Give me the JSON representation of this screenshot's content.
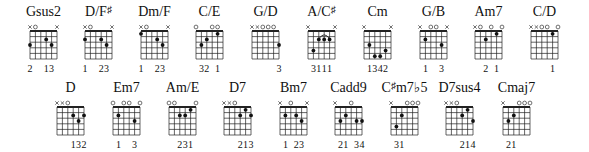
{
  "rows": [
    {
      "chords": [
        {
          "name": "Gsus2",
          "x": 30,
          "muted": [
            1,
            6
          ],
          "open": [
            2
          ],
          "nut": true,
          "dots": [
            [
              1,
              3
            ],
            [
              4,
              2
            ],
            [
              5,
              3
            ]
          ],
          "fingers": [
            [
              1,
              "2"
            ],
            [
              4,
              "1"
            ],
            [
              5,
              "3"
            ]
          ],
          "arc": null
        },
        {
          "name": "D/F",
          "sup": "♯",
          "x": 85,
          "muted": [
            1,
            6
          ],
          "open": [
            2
          ],
          "nut": true,
          "dots": [
            [
              1,
              2
            ],
            [
              4,
              2
            ],
            [
              5,
              3
            ]
          ],
          "fingers": [
            [
              1,
              "1"
            ],
            [
              4,
              "2"
            ],
            [
              5,
              "3"
            ]
          ],
          "arc": null
        },
        {
          "name": "Dm/F",
          "x": 141,
          "muted": [
            1,
            6
          ],
          "open": [
            2
          ],
          "nut": true,
          "dots": [
            [
              1,
              1
            ],
            [
              4,
              2
            ],
            [
              5,
              3
            ]
          ],
          "fingers": [
            [
              1,
              "1"
            ],
            [
              4,
              "2"
            ],
            [
              5,
              "3"
            ]
          ],
          "arc": null
        },
        {
          "name": "C/E",
          "x": 196,
          "muted": [],
          "open": [
            1,
            4,
            5
          ],
          "nut": true,
          "dots": [
            [
              2,
              3
            ],
            [
              3,
              2
            ],
            [
              5,
              1
            ]
          ],
          "fingers": [
            [
              2,
              "3"
            ],
            [
              3,
              "2"
            ],
            [
              5,
              "1"
            ]
          ],
          "arc": null
        },
        {
          "name": "G/D",
          "x": 252,
          "muted": [
            1,
            2
          ],
          "open": [
            3,
            4,
            5
          ],
          "nut": true,
          "dots": [
            [
              6,
              3
            ]
          ],
          "fingers": [
            [
              6,
              "3"
            ]
          ],
          "arc": null
        },
        {
          "name": "A/C",
          "sup": "♯",
          "x": 308,
          "muted": [
            1,
            6
          ],
          "open": [],
          "nut": true,
          "dots": [
            [
              2,
              4
            ],
            [
              3,
              2
            ],
            [
              4,
              2
            ],
            [
              5,
              2
            ]
          ],
          "fingers": [
            [
              2,
              "3"
            ],
            [
              3,
              "1"
            ],
            [
              4,
              "1"
            ],
            [
              5,
              "1"
            ]
          ],
          "arc": [
            3,
            5
          ]
        },
        {
          "name": "Cm",
          "x": 364,
          "muted": [
            1,
            6
          ],
          "open": [],
          "nut": true,
          "dots": [
            [
              2,
              3
            ],
            [
              3,
              5
            ],
            [
              4,
              5
            ],
            [
              5,
              4
            ]
          ],
          "fingers": [
            [
              2,
              "1"
            ],
            [
              3,
              "3"
            ],
            [
              4,
              "4"
            ],
            [
              5,
              "2"
            ]
          ],
          "arc": null
        },
        {
          "name": "G/B",
          "x": 420,
          "muted": [
            1,
            6
          ],
          "open": [
            3,
            4
          ],
          "nut": true,
          "dots": [
            [
              2,
              2
            ],
            [
              5,
              3
            ]
          ],
          "fingers": [
            [
              2,
              "1"
            ],
            [
              5,
              "3"
            ]
          ],
          "arc": null
        },
        {
          "name": "Am7",
          "x": 475,
          "muted": [
            1
          ],
          "open": [
            2,
            4,
            6
          ],
          "nut": true,
          "dots": [
            [
              3,
              2
            ],
            [
              5,
              1
            ]
          ],
          "fingers": [
            [
              3,
              "2"
            ],
            [
              5,
              "1"
            ]
          ],
          "arc": null
        },
        {
          "name": "C/D",
          "x": 531,
          "muted": [
            1,
            2
          ],
          "open": [
            3,
            4,
            6
          ],
          "nut": true,
          "dots": [
            [
              5,
              1
            ]
          ],
          "fingers": [
            [
              5,
              "1"
            ]
          ],
          "arc": null
        }
      ]
    },
    {
      "chords": [
        {
          "name": "D",
          "x": 57,
          "muted": [
            1,
            2
          ],
          "open": [
            3
          ],
          "nut": true,
          "dots": [
            [
              4,
              2
            ],
            [
              5,
              3
            ],
            [
              6,
              2
            ]
          ],
          "fingers": [
            [
              4,
              "1"
            ],
            [
              5,
              "3"
            ],
            [
              6,
              "2"
            ]
          ],
          "arc": null
        },
        {
          "name": "Em7",
          "x": 113,
          "muted": [],
          "open": [
            1,
            3,
            4,
            6
          ],
          "nut": true,
          "dots": [
            [
              2,
              2
            ],
            [
              5,
              3
            ]
          ],
          "fingers": [
            [
              2,
              "1"
            ],
            [
              5,
              "3"
            ]
          ],
          "arc": null
        },
        {
          "name": "Am/E",
          "x": 169,
          "muted": [],
          "open": [
            1,
            2,
            6
          ],
          "nut": true,
          "dots": [
            [
              3,
              2
            ],
            [
              4,
              2
            ],
            [
              5,
              1
            ]
          ],
          "fingers": [
            [
              3,
              "2"
            ],
            [
              4,
              "3"
            ],
            [
              5,
              "1"
            ]
          ],
          "arc": null
        },
        {
          "name": "D7",
          "x": 224,
          "muted": [
            1,
            2
          ],
          "open": [
            3
          ],
          "nut": true,
          "dots": [
            [
              4,
              2
            ],
            [
              5,
              1
            ],
            [
              6,
              2
            ]
          ],
          "fingers": [
            [
              4,
              "2"
            ],
            [
              5,
              "1"
            ],
            [
              6,
              "3"
            ]
          ],
          "arc": null
        },
        {
          "name": "Bm7",
          "x": 280,
          "muted": [
            1,
            6
          ],
          "open": [
            3
          ],
          "nut": true,
          "dots": [
            [
              2,
              2
            ],
            [
              4,
              2
            ],
            [
              5,
              3
            ]
          ],
          "fingers": [
            [
              2,
              "1"
            ],
            [
              4,
              "2"
            ],
            [
              5,
              "3"
            ]
          ],
          "arc": null
        },
        {
          "name": "Cadd9",
          "x": 335,
          "muted": [
            1
          ],
          "open": [
            4
          ],
          "nut": true,
          "dots": [
            [
              2,
              3
            ],
            [
              3,
              2
            ],
            [
              5,
              3
            ],
            [
              6,
              3
            ]
          ],
          "fingers": [
            [
              2,
              "2"
            ],
            [
              3,
              "1"
            ],
            [
              5,
              "3"
            ],
            [
              6,
              "4"
            ]
          ],
          "arc": null
        },
        {
          "name": "C",
          "sup": "♯",
          "name2": "m7♭5",
          "x": 391,
          "muted": [
            1
          ],
          "open": [
            4,
            5,
            6
          ],
          "nut": true,
          "dots": [
            [
              2,
              4
            ],
            [
              3,
              2
            ]
          ],
          "fingers": [
            [
              2,
              "3"
            ],
            [
              3,
              "1"
            ]
          ],
          "arc": null
        },
        {
          "name": "D7sus4",
          "x": 446,
          "muted": [
            1,
            2
          ],
          "open": [
            3
          ],
          "nut": true,
          "dots": [
            [
              4,
              2
            ],
            [
              5,
              1
            ],
            [
              6,
              3
            ]
          ],
          "fingers": [
            [
              4,
              "2"
            ],
            [
              5,
              "1"
            ],
            [
              6,
              "4"
            ]
          ],
          "arc": null
        },
        {
          "name": "Cmaj7",
          "x": 503,
          "muted": [
            1
          ],
          "open": [
            4,
            5,
            6
          ],
          "nut": true,
          "dots": [
            [
              2,
              3
            ],
            [
              3,
              2
            ]
          ],
          "fingers": [
            [
              2,
              "2"
            ],
            [
              3,
              "1"
            ]
          ],
          "arc": null
        }
      ]
    }
  ],
  "layout": {
    "row_tops": [
      0,
      76
    ],
    "string_gap": 5.4,
    "fret_gap": 5.6,
    "frets": 5
  }
}
